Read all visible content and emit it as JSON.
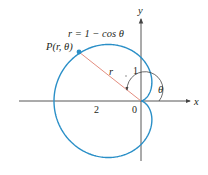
{
  "figure": {
    "equation_label": "r = 1 − cos θ",
    "point_label": "P(r, θ)",
    "radius_label": "r",
    "angle_label": "θ",
    "x_axis_label": "x",
    "y_axis_label": "y",
    "tick_labels": {
      "origin": "0",
      "x_neg_2": "2",
      "y_1": "1"
    },
    "colors": {
      "curve": "#2a8fc7",
      "radius_line": "#e08070",
      "axes": "#444444",
      "text": "#231f20"
    }
  }
}
